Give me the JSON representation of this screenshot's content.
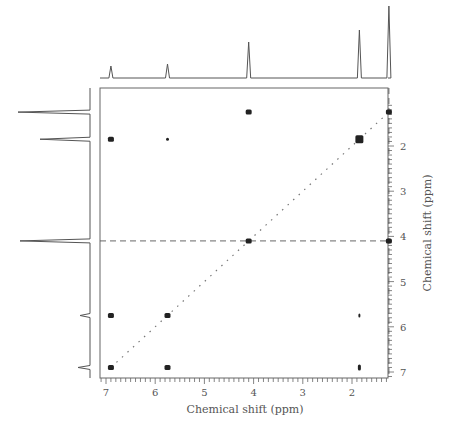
{
  "chart_data": {
    "type": "heatmap",
    "subtype": "2D NMR correlation (COSY) contour plot",
    "title": "",
    "xlabel": "Chemical shift (ppm)",
    "ylabel": "Chemical shift (ppm)",
    "x_ticks": [
      "7",
      "6",
      "5",
      "4",
      "3",
      "2"
    ],
    "y_ticks": [
      "2",
      "3",
      "4",
      "5",
      "6",
      "7"
    ],
    "xlim": [
      7.1,
      1.1
    ],
    "ylim": [
      1.1,
      7.1
    ],
    "grid": false,
    "legend": "none",
    "diagonal": {
      "from": [
        6.9,
        6.9
      ],
      "to": [
        1.25,
        1.25
      ],
      "style": "dotted"
    },
    "guide_lines": [
      {
        "orientation": "horizontal",
        "y": 4.1,
        "style": "dashed"
      },
      {
        "orientation": "vertical",
        "x": 1.25,
        "style": "dashed"
      }
    ],
    "projection_peaks_ppm": [
      6.9,
      5.75,
      4.1,
      1.85,
      1.25
    ],
    "cross_peaks": [
      {
        "x": 4.1,
        "y": 1.25
      },
      {
        "x": 1.25,
        "y": 1.25
      },
      {
        "x": 6.9,
        "y": 1.85
      },
      {
        "x": 5.75,
        "y": 1.85
      },
      {
        "x": 1.85,
        "y": 1.85
      },
      {
        "x": 4.1,
        "y": 4.1
      },
      {
        "x": 1.25,
        "y": 4.1
      },
      {
        "x": 6.9,
        "y": 5.75
      },
      {
        "x": 5.75,
        "y": 5.75
      },
      {
        "x": 1.85,
        "y": 5.75
      },
      {
        "x": 6.9,
        "y": 6.9
      },
      {
        "x": 5.75,
        "y": 6.9
      },
      {
        "x": 1.85,
        "y": 6.9
      }
    ]
  },
  "axes": {
    "x_label": "Chemical shift (ppm)",
    "y_label": "Chemical shift (ppm)"
  }
}
